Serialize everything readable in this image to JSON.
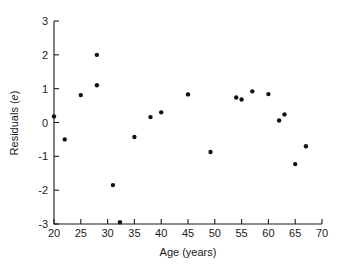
{
  "chart_data": {
    "type": "scatter",
    "title": "",
    "xlabel": "Age (years)",
    "ylabel": "Residuals (e)",
    "ylabel_parts": {
      "text": "Residuals (",
      "italic": "e",
      "close": ")"
    },
    "xlim": [
      20,
      70
    ],
    "ylim": [
      -3,
      3
    ],
    "xticks": [
      20,
      25,
      30,
      35,
      40,
      45,
      50,
      55,
      60,
      65,
      70
    ],
    "xtick_labels": [
      "20",
      "25",
      "30",
      "35",
      "40",
      "45",
      "50",
      "55",
      "60",
      "65",
      "70"
    ],
    "yticks": [
      -3,
      -2,
      -1,
      0,
      1,
      2,
      3
    ],
    "ytick_labels": [
      "-3",
      "-2",
      "-1",
      "0",
      "1",
      "2",
      "3"
    ],
    "grid": false,
    "legend": null,
    "marker": "filled-circle",
    "marker_color": "#111111",
    "marker_size_px": 4.4,
    "points": [
      {
        "x": 20.0,
        "y": 0.18
      },
      {
        "x": 22.0,
        "y": -0.5
      },
      {
        "x": 25.0,
        "y": 0.81
      },
      {
        "x": 28.0,
        "y": 2.0
      },
      {
        "x": 28.0,
        "y": 1.1
      },
      {
        "x": 31.0,
        "y": -1.85
      },
      {
        "x": 32.3,
        "y": -2.95
      },
      {
        "x": 35.0,
        "y": -0.43
      },
      {
        "x": 38.0,
        "y": 0.16
      },
      {
        "x": 40.0,
        "y": 0.3
      },
      {
        "x": 45.0,
        "y": 0.83
      },
      {
        "x": 49.2,
        "y": -0.87
      },
      {
        "x": 54.0,
        "y": 0.74
      },
      {
        "x": 55.0,
        "y": 0.68
      },
      {
        "x": 57.0,
        "y": 0.92
      },
      {
        "x": 60.0,
        "y": 0.84
      },
      {
        "x": 62.0,
        "y": 0.06
      },
      {
        "x": 63.0,
        "y": 0.24
      },
      {
        "x": 65.0,
        "y": -1.23
      },
      {
        "x": 67.0,
        "y": -0.7
      }
    ]
  },
  "plot_box": {
    "left": 54,
    "right": 322,
    "top": 21,
    "bottom": 224
  },
  "style": {
    "background": "#ffffff",
    "axis_color": "#1a1a1a",
    "point_color": "#111111"
  }
}
